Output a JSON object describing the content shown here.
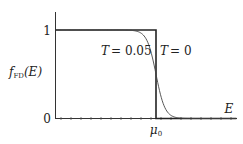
{
  "chart_data": {
    "type": "line",
    "title": "",
    "xlabel": "E",
    "ylabel": "f_FD(E)",
    "ylabel_main": "f",
    "ylabel_sub": "FD",
    "ylabel_arg": "(E)",
    "y_ticks": [
      {
        "value": 0,
        "label": "0"
      },
      {
        "value": 1,
        "label": "1"
      }
    ],
    "x_ticks": [
      {
        "value": 0.5,
        "label": "μ0",
        "label_main": "μ",
        "label_sub": "0"
      }
    ],
    "xlim": [
      0,
      0.9
    ],
    "ylim": [
      0,
      1
    ],
    "mu0": 0.5,
    "grid": false,
    "series": [
      {
        "name": "T = 0",
        "label_T": "T",
        "label_val": "= 0",
        "temperature": 0,
        "x": [
          0,
          0.5,
          0.5,
          0.9
        ],
        "y": [
          1,
          1,
          0,
          0
        ]
      },
      {
        "name": "T = 0.05",
        "label_T": "T",
        "label_val": "= 0.05",
        "temperature": 0.05,
        "x": [
          0,
          0.35,
          0.4,
          0.45,
          0.5,
          0.55,
          0.6,
          0.65,
          0.9
        ],
        "y": [
          1.0,
          0.95,
          0.88,
          0.73,
          0.5,
          0.27,
          0.12,
          0.05,
          0.0
        ]
      }
    ]
  }
}
